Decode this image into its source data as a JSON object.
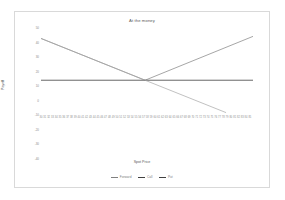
{
  "chart_data": {
    "type": "line",
    "title": "At the money",
    "xlabel": "Spot Price",
    "ylabel": "Payoff",
    "xlim": [
      30,
      85
    ],
    "ylim": [
      -40,
      50
    ],
    "grid": false,
    "legend_position": "bottom",
    "x_ticks": [
      "30",
      "31",
      "32",
      "33",
      "34",
      "35",
      "36",
      "37",
      "38",
      "39",
      "40",
      "41",
      "42",
      "43",
      "44",
      "45",
      "46",
      "47",
      "48",
      "49",
      "50",
      "51",
      "52",
      "53",
      "54",
      "55",
      "56",
      "57",
      "58",
      "59",
      "60",
      "61",
      "62",
      "63",
      "64",
      "65",
      "66",
      "67",
      "68",
      "69",
      "70",
      "71",
      "72",
      "73",
      "74",
      "75",
      "76",
      "77",
      "78",
      "79",
      "80",
      "81",
      "82",
      "83",
      "84",
      "85"
    ],
    "y_ticks": [
      "50",
      "40",
      "30",
      "20",
      "10",
      "0",
      "-10",
      "-20",
      "-30",
      "-40"
    ],
    "strike": 57,
    "series": [
      {
        "name": "Forward",
        "color": "#7f7f7f",
        "points": [
          [
            30,
            40
          ],
          [
            57,
            0
          ],
          [
            85,
            42
          ]
        ]
      },
      {
        "name": "Call",
        "color": "#404040",
        "points": [
          [
            30,
            0
          ],
          [
            85,
            0
          ]
        ]
      },
      {
        "name": "Put",
        "color": "#a6a6a6",
        "points": [
          [
            30,
            40
          ],
          [
            57,
            0
          ],
          [
            78,
            -31
          ]
        ]
      }
    ]
  },
  "legend": {
    "items": [
      {
        "label": "Forward",
        "color": "#808080"
      },
      {
        "label": "Call",
        "color": "#404040"
      },
      {
        "label": "Put",
        "color": "#404040"
      }
    ]
  },
  "colors": {
    "border": "#d9d9d9",
    "axis": "#595959",
    "tick_text": "#8c8c8c",
    "line_down": "#808080",
    "line_up": "#8c8c8c",
    "line_zero": "#404040"
  }
}
